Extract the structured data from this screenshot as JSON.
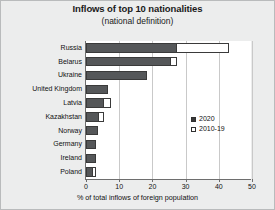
{
  "chart_data": {
    "type": "bar",
    "orientation": "horizontal",
    "title": "Inflows of top 10 nationalities",
    "subtitle": "(national definition)",
    "xlabel": "% of total inflows of foreign population",
    "ylabel": "",
    "xlim": [
      0,
      50
    ],
    "xticks": [
      0,
      10,
      20,
      30,
      40,
      50
    ],
    "grid": true,
    "grid_axis": "x",
    "legend_position": "center-right",
    "categories": [
      "Russia",
      "Belarus",
      "Ukraine",
      "United Kingdom",
      "Latvia",
      "Kazakhstan",
      "Norway",
      "Germany",
      "Ireland",
      "Poland"
    ],
    "series": [
      {
        "name": "2020",
        "style": "filled",
        "color": "#555759",
        "values": [
          27.5,
          25.5,
          18.5,
          6.5,
          5.5,
          4.0,
          3.5,
          3.0,
          3.0,
          2.0
        ]
      },
      {
        "name": "2010-19",
        "style": "hollow",
        "color": "#ffffff",
        "values": [
          43.0,
          27.5,
          18.5,
          6.5,
          7.5,
          5.5,
          3.5,
          3.0,
          3.0,
          3.0
        ]
      }
    ]
  },
  "legend": {
    "items": [
      {
        "label": "2020",
        "swatch": "filled-square"
      },
      {
        "label": "2010-19",
        "swatch": "hollow-square"
      }
    ]
  },
  "colors": {
    "figure_background": "#eceded",
    "plot_background": "#ffffff",
    "bar_2020": "#555759",
    "bar_2010_19": "#ffffff",
    "bar_outline": "#3a3a3a",
    "gridline": "#c9c9c9",
    "axis": "#6e6e6e",
    "text": "#111111"
  }
}
